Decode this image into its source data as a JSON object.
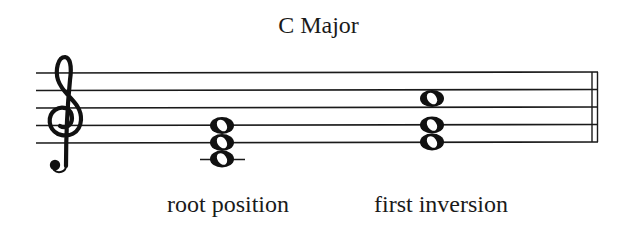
{
  "title": "C Major",
  "clef": "treble",
  "staff": {
    "line_count": 5,
    "barline": "double",
    "color": "#1a1a1a"
  },
  "chords": [
    {
      "label": "root position",
      "notes": [
        "C4",
        "E4",
        "G4"
      ],
      "note_head": "whole",
      "ledger_line": true
    },
    {
      "label": "first inversion",
      "notes": [
        "E4",
        "G4",
        "C5"
      ],
      "note_head": "whole",
      "ledger_line": false
    }
  ]
}
